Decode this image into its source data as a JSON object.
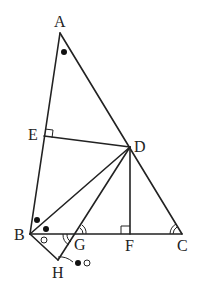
{
  "diagram": {
    "type": "geometry",
    "points": {
      "A": {
        "label": "A",
        "x": 60,
        "y": 33
      },
      "E": {
        "label": "E",
        "x": 44,
        "y": 136
      },
      "D": {
        "label": "D",
        "x": 130,
        "y": 147
      },
      "B": {
        "label": "B",
        "x": 30,
        "y": 234
      },
      "G": {
        "label": "G",
        "x": 76,
        "y": 234
      },
      "F": {
        "label": "F",
        "x": 130,
        "y": 234
      },
      "C": {
        "label": "C",
        "x": 182,
        "y": 234
      },
      "H": {
        "label": "H",
        "x": 58,
        "y": 260
      }
    },
    "segments": [
      "AB",
      "AC",
      "BC",
      "ED",
      "BD",
      "GD",
      "DF",
      "BH",
      "HG"
    ],
    "right_angles": [
      "E (DE ⊥ AB)",
      "F (DF ⊥ BC)"
    ],
    "angle_marks": {
      "filled_dot": [
        "A",
        "ABD",
        "DBH-upper"
      ],
      "open_circle": [
        "GBH"
      ],
      "double_arc": [
        "DGC",
        "C",
        "BGH"
      ]
    },
    "annotation": {
      "text": "●○",
      "target": "H"
    }
  }
}
